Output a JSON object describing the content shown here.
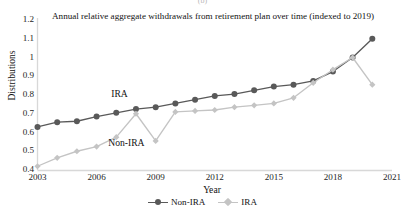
{
  "figure": {
    "panel_caption": "(b)",
    "title": "Annual relative aggregate withdrawals from retirement plan over time (indexed to 2019)"
  },
  "axes": {
    "y_axis_title": "Distributions",
    "x_axis_title": "Year",
    "y_ticks": [
      "1.2",
      "1.1",
      "1",
      "0.9",
      "0.8",
      "0.7",
      "0.6",
      "0.5",
      "0.4"
    ],
    "x_ticks": [
      "2003",
      "2006",
      "2009",
      "2012",
      "2015",
      "2018",
      "2021"
    ]
  },
  "annotations": {
    "upper_line_label": "IRA",
    "lower_line_label": "Non-IRA"
  },
  "legend": {
    "position": "bottom-center",
    "entries": [
      {
        "label": "Non-IRA",
        "color": "#595959",
        "marker": "circle"
      },
      {
        "label": "IRA",
        "color": "#c4c4c4",
        "marker": "diamond"
      }
    ]
  },
  "colors": {
    "non_ira": "#595959",
    "ira": "#c4c4c4",
    "axis": "#d8d8d8",
    "text": "#121212"
  },
  "chart_data": {
    "type": "line",
    "title": "Annual relative aggregate withdrawals from retirement plan over time (indexed to 2019)",
    "xlabel": "Year",
    "ylabel": "Distributions",
    "xlim": [
      2003,
      2021
    ],
    "ylim": [
      0.4,
      1.2
    ],
    "xtick_labels": [
      "2003",
      "2006",
      "2009",
      "2012",
      "2015",
      "2018",
      "2021"
    ],
    "ytick_labels": [
      "0.4",
      "0.5",
      "0.6",
      "0.7",
      "0.8",
      "0.9",
      "1",
      "1.1",
      "1.2"
    ],
    "grid": false,
    "legend_position": "bottom-center",
    "x": [
      2003,
      2004,
      2005,
      2006,
      2007,
      2008,
      2009,
      2010,
      2011,
      2012,
      2013,
      2014,
      2015,
      2016,
      2017,
      2018,
      2019,
      2020
    ],
    "series": [
      {
        "name": "Non-IRA",
        "color": "#595959",
        "marker": "circle",
        "values": [
          0.63,
          0.655,
          0.66,
          0.685,
          0.705,
          0.725,
          0.735,
          0.755,
          0.775,
          0.795,
          0.805,
          0.825,
          0.845,
          0.855,
          0.875,
          0.925,
          1.0,
          1.1
        ]
      },
      {
        "name": "IRA",
        "color": "#c4c4c4",
        "marker": "diamond",
        "values": [
          0.42,
          0.465,
          0.5,
          0.525,
          0.575,
          0.7,
          0.555,
          0.71,
          0.715,
          0.72,
          0.735,
          0.745,
          0.755,
          0.785,
          0.865,
          0.935,
          1.0,
          0.855
        ]
      }
    ]
  }
}
